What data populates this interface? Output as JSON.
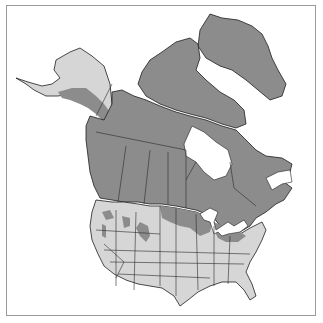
{
  "map": {
    "title": "",
    "region": "North America",
    "legend": {
      "range_color": "#8c8c8c",
      "other_color": "#d6d6d6",
      "water_color": "#ffffff",
      "border_color": "#1e1e1e"
    }
  }
}
